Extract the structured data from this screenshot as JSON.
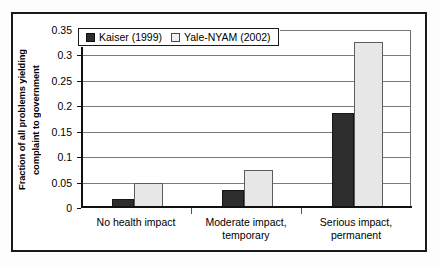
{
  "chart_data": {
    "type": "bar",
    "title": "",
    "xlabel": "",
    "ylabel_line1": "Fraction of all problems yielding",
    "ylabel_line2": "complaint to government",
    "ylim": [
      0,
      0.35
    ],
    "ytick_labels": [
      "0",
      "0.05",
      "0.1",
      "0.15",
      "0.2",
      "0.25",
      "0.3",
      "0.35"
    ],
    "ytick_values": [
      0,
      0.05,
      0.1,
      0.15,
      0.2,
      0.25,
      0.3,
      0.35
    ],
    "grid": "horizontal",
    "legend_position": "top-left-inside",
    "categories": [
      "No health impact",
      "Moderate impact, temporary",
      "Serious impact, permanent"
    ],
    "category_lines": [
      [
        "No health impact"
      ],
      [
        "Moderate impact,",
        "temporary"
      ],
      [
        "Serious impact,",
        "permanent"
      ]
    ],
    "series": [
      {
        "name": "Kaiser (1999)",
        "color": "#2d2d2d",
        "values": [
          0.017,
          0.036,
          0.186
        ]
      },
      {
        "name": "Yale-NYAM (2002)",
        "color": "#e7e7e7",
        "values": [
          0.05,
          0.074,
          0.327
        ]
      }
    ]
  },
  "legend": {
    "items": [
      {
        "label": "Kaiser (1999)",
        "swatch": "dark-square-icon"
      },
      {
        "label": "Yale-NYAM (2002)",
        "swatch": "light-square-icon"
      }
    ]
  }
}
